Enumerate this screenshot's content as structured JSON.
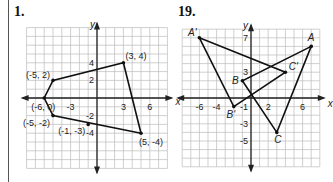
{
  "problems": [
    {
      "number": "1.",
      "axis_x": "x",
      "axis_y": "y",
      "ticks_x": [
        {
          "v": -3,
          "label": "-3"
        },
        {
          "v": 3,
          "label": "3"
        },
        {
          "v": 6,
          "label": "6"
        }
      ],
      "ticks_y": [
        {
          "v": 4,
          "label": "4"
        },
        {
          "v": 2,
          "label": "2"
        },
        {
          "v": -2,
          "label": "-2"
        },
        {
          "v": -4,
          "label": "-4"
        }
      ],
      "polygon": [
        [
          3,
          4
        ],
        [
          5,
          -4
        ],
        [
          -5,
          -2
        ],
        [
          -6,
          0
        ],
        [
          -5,
          2
        ]
      ],
      "extra_points": [
        [
          -1,
          -3
        ]
      ],
      "point_labels": [
        {
          "text": "(3, 4)",
          "x": 3,
          "y": 4
        },
        {
          "text": "(-5, 2)",
          "x": -5,
          "y": 2
        },
        {
          "text": "(-6, 0)",
          "x": -6,
          "y": 0
        },
        {
          "text": "(-5, -2)",
          "x": -5,
          "y": -2
        },
        {
          "text": "(-1, -3)",
          "x": -1,
          "y": -3
        },
        {
          "text": "(5, -4)",
          "x": 5,
          "y": -4
        }
      ]
    },
    {
      "number": "19.",
      "axis_x": "x",
      "axis_y": "y",
      "ticks_x": [
        {
          "v": -6,
          "label": "-6"
        },
        {
          "v": -4,
          "label": "-4"
        },
        {
          "v": 2,
          "label": "2"
        },
        {
          "v": 6,
          "label": "6"
        }
      ],
      "ticks_y": [
        {
          "v": 7,
          "label": "7"
        },
        {
          "v": 3,
          "label": "3"
        },
        {
          "v": -1,
          "label": "-1"
        },
        {
          "v": -3,
          "label": "-3"
        },
        {
          "v": -5,
          "label": "-5"
        }
      ],
      "triangles": [
        {
          "name": "ABC",
          "vertices": [
            {
              "label": "A",
              "x": 7,
              "y": 6
            },
            {
              "label": "B",
              "x": -1,
              "y": 2
            },
            {
              "label": "C",
              "x": 3,
              "y": -4
            }
          ]
        },
        {
          "name": "A'B'C'",
          "vertices": [
            {
              "label": "A'",
              "x": -6,
              "y": 7
            },
            {
              "label": "B'",
              "x": -2,
              "y": -1
            },
            {
              "label": "C'",
              "x": 4,
              "y": 3
            }
          ]
        }
      ]
    }
  ]
}
